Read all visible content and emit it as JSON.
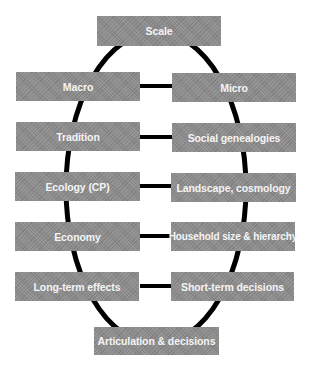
{
  "diagram": {
    "top": {
      "label": "Scale"
    },
    "bottom": {
      "label": "Articulation & decisions"
    },
    "left": [
      {
        "label": "Macro"
      },
      {
        "label": "Tradition"
      },
      {
        "label": "Ecology (CP)"
      },
      {
        "label": "Economy"
      },
      {
        "label": "Long-term effects"
      }
    ],
    "right": [
      {
        "label": "Micro"
      },
      {
        "label": "Social genealogies"
      },
      {
        "label": "Landscape, cosmology"
      },
      {
        "label": "Household size & hierarchy"
      },
      {
        "label": "Short-term decisions"
      }
    ],
    "colors": {
      "box_fill": "#8c8c8c",
      "box_text": "#f4f4f4",
      "line": "#000000"
    }
  }
}
